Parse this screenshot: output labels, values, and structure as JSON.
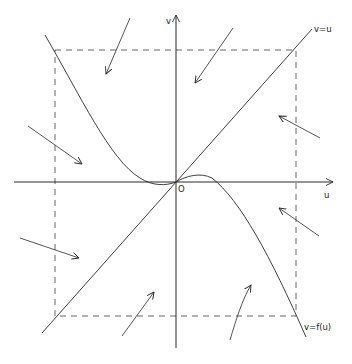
{
  "diagram": {
    "colors": {
      "stroke": "#2a2a2a",
      "dash": "#555555",
      "background": "#ffffff"
    },
    "labels": {
      "v_axis": "v",
      "u_axis": "u",
      "origin": "O",
      "line_vu": "v=u",
      "curve_f": "v=f(u)"
    },
    "elements": {
      "axes": [
        "u-axis",
        "v-axis"
      ],
      "nullclines": [
        "v=u (straight line through origin)",
        "v=f(u) (cubic-like curve through origin)"
      ],
      "bounding_box": "dashed rectangle",
      "flow_arrows": 8
    }
  }
}
